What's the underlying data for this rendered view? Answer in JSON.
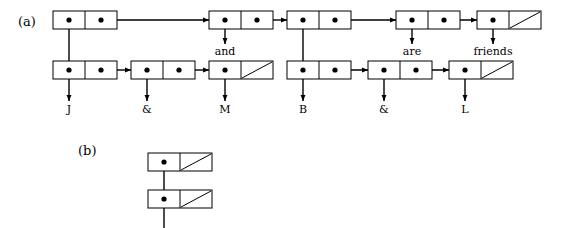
{
  "figure": {
    "panels": [
      {
        "id": "a",
        "label": "(a)",
        "label_x": 18,
        "label_y": 26
      },
      {
        "id": "b",
        "label": "(b)",
        "label_x": 78,
        "label_y": 155
      }
    ],
    "geometry": {
      "cell_width": 64,
      "cell_height": 18,
      "half_width": 32,
      "dot_radius": 2.6,
      "arrow_size": 4
    },
    "style": {
      "background": "#ffffff",
      "ink": "#000000",
      "box_fill": "#ffffff",
      "line_width": 1
    },
    "panel_a": {
      "top_row_y": 11,
      "bottom_row_y": 61,
      "cells_top": [
        {
          "name": "top-cell-1",
          "x": 53,
          "car": "pointer-down",
          "cdr": "pointer-right"
        },
        {
          "name": "top-cell-2",
          "x": 209,
          "car": "pointer-down",
          "cdr": "pointer-right"
        },
        {
          "name": "top-cell-3",
          "x": 287,
          "car": "pointer-down",
          "cdr": "pointer-right"
        },
        {
          "name": "top-cell-4",
          "x": 396,
          "car": "pointer-down",
          "cdr": "pointer-right"
        },
        {
          "name": "top-cell-5",
          "x": 477,
          "car": "pointer-down",
          "cdr": "nil"
        }
      ],
      "cells_bottom": [
        {
          "name": "bottom-cell-1",
          "x": 53,
          "car": "pointer-down",
          "cdr": "pointer-right"
        },
        {
          "name": "bottom-cell-2",
          "x": 131,
          "car": "pointer-down",
          "cdr": "pointer-right"
        },
        {
          "name": "bottom-cell-3",
          "x": 209,
          "car": "pointer-down",
          "cdr": "nil"
        },
        {
          "name": "bottom-cell-4",
          "x": 287,
          "car": "pointer-down",
          "cdr": "pointer-right"
        },
        {
          "name": "bottom-cell-5",
          "x": 368,
          "car": "pointer-down",
          "cdr": "pointer-right"
        },
        {
          "name": "bottom-cell-6",
          "x": 449,
          "car": "pointer-down",
          "cdr": "nil"
        }
      ],
      "leaf_labels": [
        {
          "name": "leaf-label-j",
          "text": "J",
          "x": 69,
          "y": 113
        },
        {
          "name": "leaf-label-amp-1",
          "text": "&",
          "x": 147,
          "y": 113
        },
        {
          "name": "leaf-label-m",
          "text": "M",
          "x": 225,
          "y": 113
        },
        {
          "name": "leaf-label-b",
          "text": "B",
          "x": 303,
          "y": 113
        },
        {
          "name": "leaf-label-amp-2",
          "text": "&",
          "x": 384,
          "y": 113
        },
        {
          "name": "leaf-label-l",
          "text": "L",
          "x": 465,
          "y": 113
        }
      ],
      "mid_labels": [
        {
          "name": "mid-label-and",
          "text": "and",
          "x": 225,
          "y": 55
        },
        {
          "name": "mid-label-are",
          "text": "are",
          "x": 412,
          "y": 55
        },
        {
          "name": "mid-label-friends",
          "text": "friends",
          "x": 493,
          "y": 55
        }
      ]
    },
    "panel_b": {
      "cells": [
        {
          "name": "panel-b-cell-1",
          "x": 148,
          "y": 153,
          "car": "pointer-down",
          "cdr": "nil"
        },
        {
          "name": "panel-b-cell-2",
          "x": 148,
          "y": 190,
          "car": "pointer-down",
          "cdr": "nil"
        }
      ],
      "tail_line": {
        "x": 164,
        "from_y": 208,
        "to_y": 228
      }
    },
    "connections_a": [
      {
        "name": "link-top1-cdr-to-top2",
        "type": "horizontal",
        "from_x": 101,
        "to_x": 209,
        "y": 20
      },
      {
        "name": "link-top2-cdr-to-top3",
        "type": "horizontal",
        "from_x": 257,
        "to_x": 287,
        "y": 20
      },
      {
        "name": "link-top3-cdr-to-top4",
        "type": "horizontal",
        "from_x": 335,
        "to_x": 396,
        "y": 20
      },
      {
        "name": "link-top4-cdr-to-top5",
        "type": "horizontal",
        "from_x": 444,
        "to_x": 477,
        "y": 20
      },
      {
        "name": "link-top1-car-to-bottom1",
        "type": "vertical",
        "x": 69,
        "from_y": 20,
        "to_y": 70
      },
      {
        "name": "link-top2-car-down",
        "type": "vertical",
        "x": 225,
        "from_y": 20,
        "to_y": 44
      },
      {
        "name": "link-top3-car-to-bottom4",
        "type": "vertical",
        "x": 303,
        "from_y": 20,
        "to_y": 70
      },
      {
        "name": "link-top4-car-down",
        "type": "vertical",
        "x": 412,
        "from_y": 20,
        "to_y": 44
      },
      {
        "name": "link-top5-car-down",
        "type": "vertical",
        "x": 493,
        "from_y": 20,
        "to_y": 44
      },
      {
        "name": "link-bottom1-cdr-to-bottom2",
        "type": "horizontal",
        "from_x": 101,
        "to_x": 131,
        "y": 70
      },
      {
        "name": "link-bottom2-cdr-to-bottom3",
        "type": "horizontal",
        "from_x": 179,
        "to_x": 209,
        "y": 70
      },
      {
        "name": "link-bottom4-cdr-to-bottom5",
        "type": "horizontal",
        "from_x": 335,
        "to_x": 368,
        "y": 70
      },
      {
        "name": "link-bottom5-cdr-to-bottom6",
        "type": "horizontal",
        "from_x": 416,
        "to_x": 449,
        "y": 70
      },
      {
        "name": "link-bottom1-car-to-j",
        "type": "vertical",
        "x": 69,
        "from_y": 70,
        "to_y": 101
      },
      {
        "name": "link-bottom2-car-to-amp1",
        "type": "vertical",
        "x": 147,
        "from_y": 70,
        "to_y": 101
      },
      {
        "name": "link-bottom3-car-to-m",
        "type": "vertical",
        "x": 225,
        "from_y": 70,
        "to_y": 101
      },
      {
        "name": "link-bottom4-car-to-b",
        "type": "vertical",
        "x": 303,
        "from_y": 70,
        "to_y": 101
      },
      {
        "name": "link-bottom5-car-to-amp2",
        "type": "vertical",
        "x": 384,
        "from_y": 70,
        "to_y": 101
      },
      {
        "name": "link-bottom6-car-to-l",
        "type": "vertical",
        "x": 465,
        "from_y": 70,
        "to_y": 101
      }
    ],
    "connections_b": [
      {
        "name": "link-b-cell1-car-to-cell2",
        "type": "vertical",
        "x": 164,
        "from_y": 162,
        "to_y": 199
      }
    ]
  }
}
